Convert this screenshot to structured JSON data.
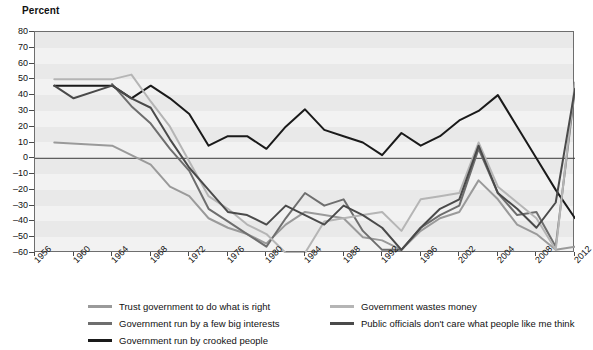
{
  "axis_title": "Percent",
  "legend": {
    "left_items": [
      {
        "label": "Trust government to do what is right",
        "color": "#9a9a9a"
      },
      {
        "label": "Government run by a few big interests",
        "color": "#6e6e6e"
      },
      {
        "label": "Government run by crooked people",
        "color": "#1a1a1a"
      }
    ],
    "right_items": [
      {
        "label": "Government wastes money",
        "color": "#b5b5b5"
      },
      {
        "label": "Public officials don't care what people like me think",
        "color": "#4a4a4a"
      }
    ]
  },
  "chart_data": {
    "type": "line",
    "title": "",
    "subtitle": "",
    "xlabel": "",
    "ylabel": "Percent",
    "ylim": [
      -60,
      80
    ],
    "xlim": [
      1956,
      2012
    ],
    "yticks": [
      -60,
      -50,
      -40,
      -30,
      -20,
      -10,
      0,
      10,
      20,
      30,
      40,
      50,
      60,
      70,
      80
    ],
    "xtick_labels": [
      "1956",
      "1960",
      "1964",
      "1968",
      "1972",
      "1976",
      "1980",
      "1984",
      "1988",
      "1992",
      "1996",
      "2002",
      "2004",
      "2008",
      "2012"
    ],
    "xtick_values": [
      1956,
      1960,
      1964,
      1968,
      1972,
      1976,
      1980,
      1984,
      1988,
      1992,
      1996,
      2000,
      2004,
      2008,
      2012
    ],
    "grid": false,
    "zero_line": true,
    "legend_position": "below",
    "x": [
      1958,
      1960,
      1962,
      1964,
      1966,
      1968,
      1970,
      1972,
      1974,
      1976,
      1978,
      1980,
      1982,
      1984,
      1986,
      1988,
      1990,
      1992,
      1994,
      1996,
      1998,
      2000,
      2002,
      2004,
      2006,
      2008,
      2010,
      2012
    ],
    "series": [
      {
        "name": "Trust government to do what is right",
        "color": "#9a9a9a",
        "x": [
          1958,
          1964,
          1966,
          1968,
          1970,
          1972,
          1974,
          1976,
          1978,
          1980,
          1982,
          1984,
          1986,
          1988,
          1990,
          1992,
          1994,
          1996,
          1998,
          2000,
          2002,
          2004,
          2006,
          2008,
          2010,
          2012
        ],
        "values": [
          10,
          8,
          2,
          -4,
          -18,
          -24,
          -38,
          -44,
          -48,
          -54,
          -42,
          -34,
          -36,
          -38,
          -50,
          -52,
          -58,
          -46,
          -38,
          -34,
          -14,
          -26,
          -42,
          -48,
          -58,
          -56
        ]
      },
      {
        "name": "Government run by a few big interests",
        "color": "#6e6e6e",
        "x": [
          1964,
          1966,
          1968,
          1970,
          1972,
          1974,
          1976,
          1978,
          1980,
          1982,
          1984,
          1986,
          1988,
          1990,
          1992,
          1994,
          1996,
          1998,
          2000,
          2002,
          2004,
          2006,
          2008,
          2010,
          2012
        ],
        "values": [
          47,
          33,
          22,
          6,
          -8,
          -32,
          -40,
          -48,
          -56,
          -38,
          -22,
          -30,
          -26,
          -46,
          -58,
          -58,
          -44,
          -36,
          -30,
          6,
          -22,
          -36,
          -34,
          -56,
          44
        ]
      },
      {
        "name": "Government run by crooked people",
        "color": "#1a1a1a",
        "x": [
          1958,
          1964,
          1966,
          1968,
          1970,
          1972,
          1974,
          1976,
          1978,
          1980,
          1982,
          1984,
          1986,
          1988,
          1990,
          1992,
          1994,
          1996,
          1998,
          2000,
          2002,
          2004,
          2006,
          2008,
          2010,
          2012
        ],
        "values": [
          46,
          46,
          38,
          46,
          38,
          28,
          8,
          14,
          14,
          6,
          20,
          31,
          18,
          14,
          10,
          2,
          16,
          8,
          14,
          24,
          30,
          40,
          20,
          0,
          -20,
          -38
        ]
      },
      {
        "name": "Government wastes money",
        "color": "#b5b5b5",
        "x": [
          1958,
          1964,
          1966,
          1968,
          1970,
          1972,
          1974,
          1976,
          1978,
          1980,
          1982,
          1984,
          1986,
          1988,
          1990,
          1992,
          1994,
          1996,
          1998,
          2000,
          2002,
          2004,
          2006,
          2008,
          2010,
          2012
        ],
        "values": [
          50,
          50,
          53,
          36,
          20,
          -2,
          -24,
          -32,
          -42,
          -48,
          -60,
          -60,
          -40,
          -38,
          -36,
          -34,
          -46,
          -26,
          -24,
          -22,
          10,
          -18,
          -28,
          -38,
          -58,
          48
        ]
      },
      {
        "name": "Public officials don't care what people like me think",
        "color": "#4a4a4a",
        "x": [
          1958,
          1960,
          1964,
          1966,
          1968,
          1970,
          1972,
          1974,
          1976,
          1978,
          1980,
          1982,
          1984,
          1986,
          1988,
          1990,
          1992,
          1994,
          1996,
          1998,
          2000,
          2002,
          2004,
          2006,
          2008,
          2010,
          2012
        ],
        "values": [
          46,
          38,
          46,
          38,
          32,
          12,
          -6,
          -20,
          -34,
          -36,
          -42,
          -30,
          -36,
          -42,
          -30,
          -36,
          -44,
          -58,
          -44,
          -32,
          -26,
          8,
          -22,
          -32,
          -44,
          -28,
          44
        ]
      }
    ]
  }
}
